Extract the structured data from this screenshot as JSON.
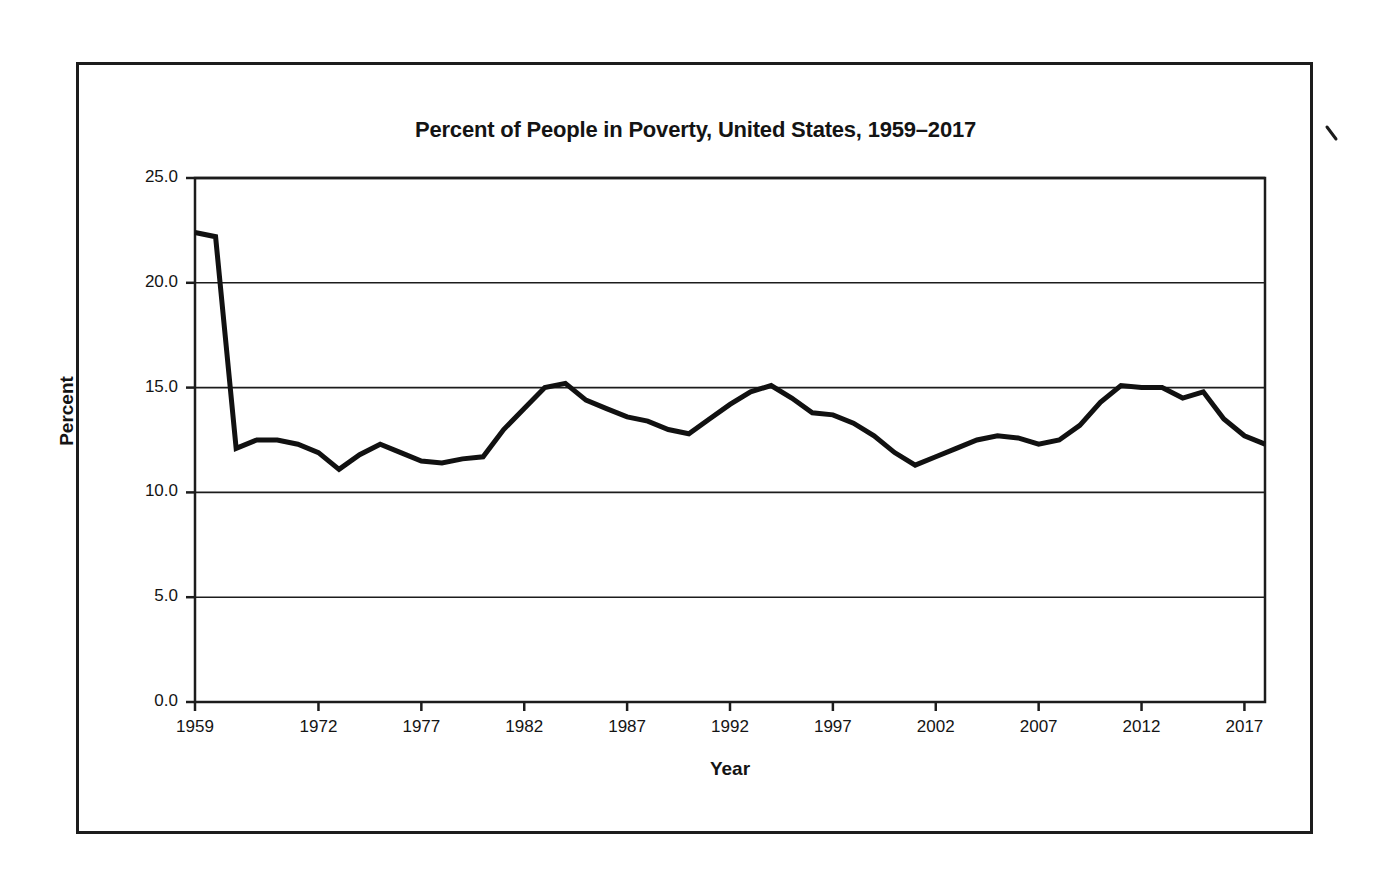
{
  "document": {
    "frame_present": true,
    "artifact": "scan-tick-mark"
  },
  "chart_data": {
    "type": "line",
    "title": "Percent of People in Poverty, United States, 1959–2017",
    "xlabel": "Year",
    "ylabel": "Percent",
    "ylim": [
      0.0,
      25.0
    ],
    "ytick_step": 5.0,
    "ytick_labels": [
      "25.0",
      "20.0",
      "15.0",
      "10.0",
      "5.0",
      "0.0"
    ],
    "ytick_values": [
      25.0,
      20.0,
      15.0,
      10.0,
      5.0,
      0.0
    ],
    "xtick_labels": [
      "1959",
      "1972",
      "1977",
      "1982",
      "1987",
      "1992",
      "1997",
      "2002",
      "2007",
      "2012",
      "2017"
    ],
    "xtick_indices": [
      0,
      6,
      11,
      16,
      21,
      26,
      31,
      36,
      41,
      46,
      51
    ],
    "grid": "horizontal",
    "legend": "none",
    "line_color": "#111111",
    "line_width_px": 5,
    "x": [
      1959,
      1966,
      1967,
      1968,
      1969,
      1970,
      1971,
      1972,
      1973,
      1974,
      1975,
      1976,
      1977,
      1978,
      1979,
      1980,
      1981,
      1982,
      1983,
      1984,
      1985,
      1986,
      1987,
      1988,
      1989,
      1990,
      1991,
      1992,
      1993,
      1994,
      1995,
      1996,
      1997,
      1998,
      1999,
      2000,
      2001,
      2002,
      2003,
      2004,
      2005,
      2006,
      2007,
      2008,
      2009,
      2010,
      2011,
      2012,
      2013,
      2014,
      2015,
      2016,
      2017
    ],
    "values": [
      22.4,
      22.2,
      12.1,
      12.5,
      12.5,
      12.3,
      11.9,
      11.1,
      11.8,
      12.3,
      11.9,
      11.5,
      11.4,
      11.6,
      11.7,
      13.0,
      14.0,
      15.0,
      15.2,
      14.4,
      14.0,
      13.6,
      13.4,
      13.0,
      12.8,
      13.5,
      14.2,
      14.8,
      15.1,
      14.5,
      13.8,
      13.7,
      13.3,
      12.7,
      11.9,
      11.3,
      11.7,
      12.1,
      12.5,
      12.7,
      12.6,
      12.3,
      12.5,
      13.2,
      14.3,
      15.1,
      15.0,
      15.0,
      14.5,
      14.8,
      13.5,
      12.7,
      12.3
    ],
    "series": [
      {
        "name": "Percent of people in poverty",
        "values": [
          22.4,
          22.2,
          12.1,
          12.5,
          12.5,
          12.3,
          11.9,
          11.1,
          11.8,
          12.3,
          11.9,
          11.5,
          11.4,
          11.6,
          11.7,
          13.0,
          14.0,
          15.0,
          15.2,
          14.4,
          14.0,
          13.6,
          13.4,
          13.0,
          12.8,
          13.5,
          14.2,
          14.8,
          15.1,
          14.5,
          13.8,
          13.7,
          13.3,
          12.7,
          11.9,
          11.3,
          11.7,
          12.1,
          12.5,
          12.7,
          12.6,
          12.3,
          12.5,
          13.2,
          14.3,
          15.1,
          15.0,
          15.0,
          14.5,
          14.8,
          13.5,
          12.7,
          12.3
        ]
      }
    ]
  }
}
